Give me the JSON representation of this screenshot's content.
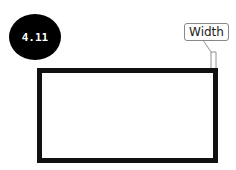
{
  "figure": {
    "badge_label": "4.11",
    "callout_label": "Width",
    "colors": {
      "stroke": "#111111",
      "badge_bg": "#000000",
      "badge_text": "#ffffff"
    }
  }
}
